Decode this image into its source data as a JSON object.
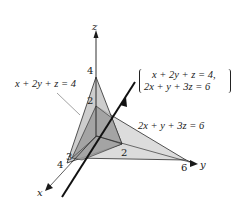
{
  "diagram": {
    "type": "3d-planes-intersection",
    "axes": {
      "x_label": "x",
      "y_label": "y",
      "z_label": "z"
    },
    "plane1": {
      "equation": "x + 2y + z = 4",
      "intercepts": {
        "x": "4",
        "y": "2",
        "z": "4"
      },
      "fill": "#c9c9c9"
    },
    "plane2": {
      "equation": "2x + y + 3z = 6",
      "intercepts": {
        "x": "3",
        "y": "6",
        "z": "2"
      },
      "fill": "#dcdcdc"
    },
    "intersection_line": {
      "system_line1": "x + 2y + z = 4,",
      "system_line2": "2x + y + 3z = 6"
    },
    "overlap_fill": "#9a9a9a",
    "tick_labels": {
      "z4": "4",
      "z2": "2",
      "y2": "2",
      "y6": "6",
      "x3": "3",
      "x4": "4"
    }
  }
}
